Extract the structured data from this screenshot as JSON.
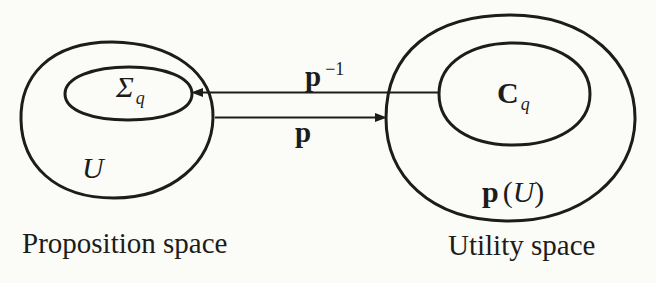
{
  "colors": {
    "background": "#fbfbf8",
    "ink": "#1c1c1a"
  },
  "proposition_space": {
    "caption": "Proposition space",
    "set_label": "U",
    "subset": {
      "base": "Σ",
      "subscript": "q"
    }
  },
  "utility_space": {
    "caption": "Utility space",
    "set_label": {
      "map": "p",
      "open_paren": "(",
      "argument": "U",
      "close_paren": ")"
    },
    "subset": {
      "base": "C",
      "subscript": "q"
    }
  },
  "maps": {
    "inverse": {
      "base": "p",
      "superscript": "−1"
    },
    "forward": {
      "label": "p"
    }
  }
}
